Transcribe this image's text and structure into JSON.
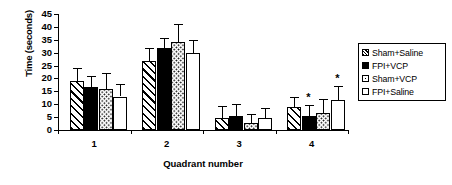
{
  "chart_data": {
    "type": "bar",
    "title": "",
    "xlabel": "Quadrant number",
    "ylabel": "Time (seconds)",
    "categories": [
      "1",
      "2",
      "3",
      "4"
    ],
    "ylim": [
      0,
      45
    ],
    "yticks": [
      0,
      5,
      10,
      15,
      20,
      25,
      30,
      35,
      40,
      45
    ],
    "ytick_labels": [
      "0",
      "5",
      "10",
      "15",
      "20",
      "25",
      "30",
      "35",
      "40",
      "45"
    ],
    "grid": false,
    "legend_position": "right",
    "series": [
      {
        "name": "Sham+Saline",
        "pattern": "diagonal-hatch",
        "values": [
          19.0,
          26.7,
          4.8,
          8.8
        ],
        "errors": [
          5.0,
          5.0,
          4.5,
          4.0
        ]
      },
      {
        "name": "FPI+VCP",
        "pattern": "solid-black",
        "values": [
          16.8,
          31.8,
          5.6,
          5.6
        ],
        "errors": [
          4.0,
          4.0,
          4.5,
          4.0
        ]
      },
      {
        "name": "Sham+VCP",
        "pattern": "dotted",
        "values": [
          16.0,
          34.0,
          2.7,
          6.5
        ],
        "errors": [
          6.0,
          7.0,
          3.5,
          5.5
        ]
      },
      {
        "name": "FPI+Saline",
        "pattern": "open-white",
        "values": [
          13.0,
          30.0,
          4.7,
          11.5
        ],
        "errors": [
          5.0,
          5.0,
          4.0,
          5.5
        ]
      }
    ],
    "annotations": [
      {
        "text": "*",
        "category": "4",
        "series": "FPI+VCP"
      },
      {
        "text": "*",
        "category": "4",
        "series": "FPI+Saline"
      }
    ],
    "colors": {
      "axis": "#000000",
      "bar_outline": "#000000",
      "fill_solid": "#000000",
      "fill_open": "#ffffff",
      "background": "#ffffff"
    }
  },
  "legend": {
    "items": [
      {
        "label": "Sham+Saline",
        "pattern": "diagonal-hatch"
      },
      {
        "label": "FPI+VCP",
        "pattern": "solid-black"
      },
      {
        "label": "Sham+VCP",
        "pattern": "dotted"
      },
      {
        "label": "FPI+Saline",
        "pattern": "open-white"
      }
    ]
  }
}
